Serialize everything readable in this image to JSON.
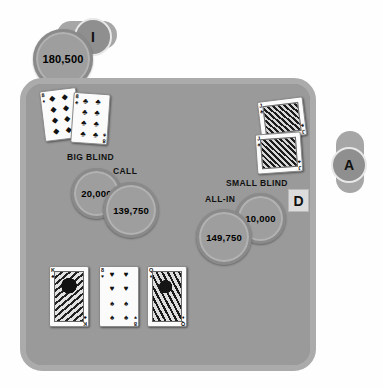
{
  "table": {
    "felt_color": "#9a9a9a",
    "rail_color": "#ababab"
  },
  "players": [
    {
      "seat": "top-left",
      "badge": "I",
      "stack_chip": "180,500",
      "label": "BIG BLIND",
      "bet_chip": "20,000",
      "action_label": "CALL",
      "action_chip": "139,750",
      "cards": [
        {
          "rank": "8",
          "suit": "diamonds",
          "suit_glyph": "♦",
          "pip_count": 8
        },
        {
          "rank": "8",
          "suit": "clubs",
          "suit_glyph": "♣",
          "pip_count": 8
        }
      ]
    },
    {
      "seat": "right",
      "badge": "A",
      "label": "SMALL BLIND",
      "bet_chip": "10,000",
      "action_label": "ALL-IN",
      "action_chip": "149,750",
      "dealer_button": "D",
      "cards": [
        {
          "rank": "J",
          "suit": "clubs",
          "suit_glyph": "♣",
          "face": true
        },
        {
          "rank": "J",
          "suit": "clubs",
          "suit_glyph": "♣",
          "face": true
        }
      ]
    }
  ],
  "community_cards": [
    {
      "rank": "K",
      "suit": "clubs",
      "suit_glyph": "♣",
      "face": true
    },
    {
      "rank": "8",
      "suit": "hearts",
      "suit_glyph": "♥",
      "pip_count": 8
    },
    {
      "rank": "Q",
      "suit": "diamonds",
      "suit_glyph": "♦",
      "face": true
    }
  ]
}
